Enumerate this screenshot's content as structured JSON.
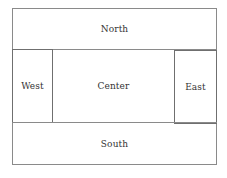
{
  "diagram": {
    "type": "border-layout",
    "regions": {
      "north": "North",
      "west": "West",
      "center": "Center",
      "east": "East",
      "south": "South"
    },
    "colors": {
      "border": "#8a8a8a",
      "text": "#333333",
      "background": "#ffffff"
    }
  }
}
